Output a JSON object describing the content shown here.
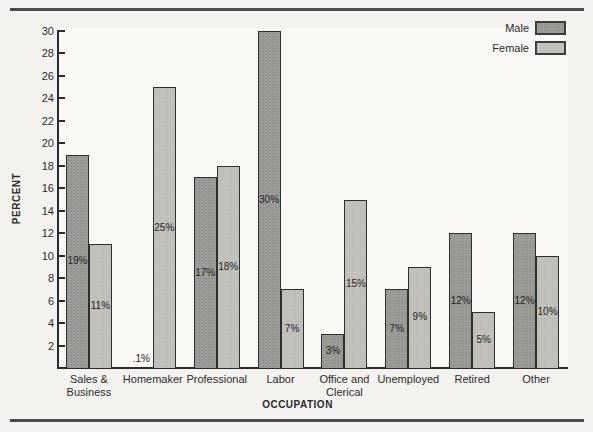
{
  "page": {
    "background": "#f3f2ee",
    "rule_color": "#4c4c4c"
  },
  "legend": {
    "items": [
      {
        "label": "Male",
        "color": "#9b9b97"
      },
      {
        "label": "Female",
        "color": "#c2c1bb"
      }
    ]
  },
  "chart_data": {
    "type": "bar",
    "title": "",
    "xlabel": "OCCUPATION",
    "ylabel": "PERCENT",
    "ylim": [
      0,
      30
    ],
    "ytick_step": 2,
    "grid": false,
    "legend_position": "top-right",
    "categories": [
      "Sales & Business",
      "Homemaker",
      "Professional",
      "Labor",
      "Office and Clerical",
      "Unemployed",
      "Retired",
      "Other"
    ],
    "category_label_lines": [
      [
        "Sales &",
        "Business"
      ],
      [
        "Homemaker"
      ],
      [
        "Professional"
      ],
      [
        "Labor"
      ],
      [
        "Office and",
        "Clerical"
      ],
      [
        "Unemployed"
      ],
      [
        "Retired"
      ],
      [
        "Other"
      ]
    ],
    "series": [
      {
        "name": "Male",
        "color": "#9b9b97",
        "values": [
          19,
          0.1,
          17,
          30,
          3,
          7,
          12,
          12
        ],
        "labels": [
          "19%",
          ".1%",
          "17%",
          "30%",
          "3%",
          "7%",
          "12%",
          "12%"
        ]
      },
      {
        "name": "Female",
        "color": "#c2c1bb",
        "values": [
          11,
          25,
          18,
          7,
          15,
          9,
          5,
          10
        ],
        "labels": [
          "11%",
          "25%",
          "18%",
          "7%",
          "15%",
          "9%",
          "5%",
          "10%"
        ]
      }
    ]
  }
}
